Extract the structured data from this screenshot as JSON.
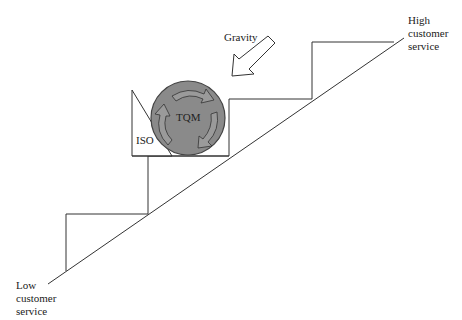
{
  "diagram": {
    "labels": {
      "gravity": "Gravity",
      "iso": "ISO",
      "tqm": "TQM",
      "high": [
        "High",
        "customer",
        "service"
      ],
      "low": [
        "Low",
        "customer",
        "service"
      ]
    },
    "colors": {
      "line": "#333333",
      "ball_fill": "#8a8a8a",
      "ball_stroke": "#444444",
      "arrow_fill": "#ffffff"
    },
    "icons": {
      "gravity_arrow": "arrow-down-left-icon",
      "rotation_arrows": "circular-arrows-icon"
    }
  }
}
